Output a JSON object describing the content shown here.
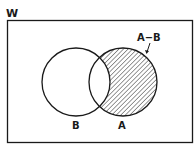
{
  "diagram": {
    "type": "venn",
    "universe_label": "W",
    "sets": [
      {
        "name": "B",
        "label": "B",
        "cx": 76,
        "cy": 82,
        "r": 34
      },
      {
        "name": "A",
        "label": "A",
        "cx": 123,
        "cy": 82,
        "r": 34
      }
    ],
    "shaded_region": {
      "label": "A−B",
      "description": "A minus B (hatched)"
    },
    "colors": {
      "stroke": "#1a1a1a",
      "hatch": "#333333",
      "background": "#ffffff"
    }
  }
}
